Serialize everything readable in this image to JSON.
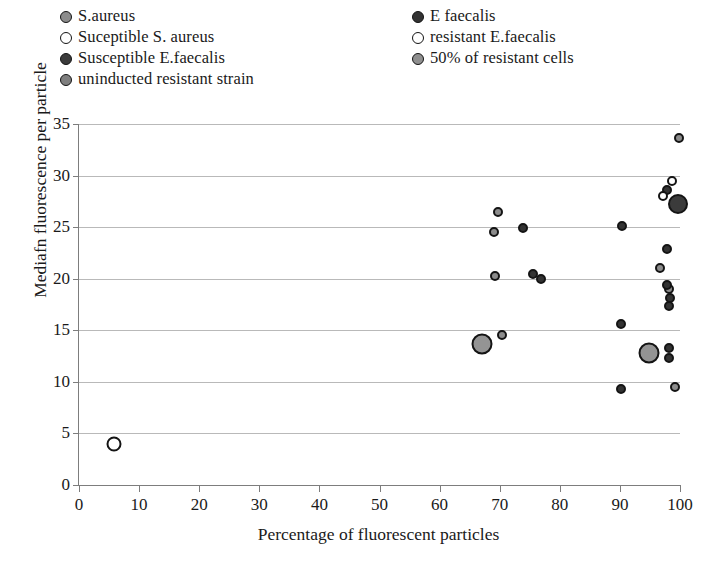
{
  "legend": {
    "left_column": [
      {
        "label": "S.aureus",
        "marker": "circle",
        "fill": "#8c8c8c",
        "stroke": "#141414"
      },
      {
        "label": "Suceptible S. aureus",
        "marker": "circle",
        "fill": "#ffffff",
        "stroke": "#141414"
      },
      {
        "label": "Susceptible E.faecalis",
        "marker": "circle",
        "fill": "#3b3b3b",
        "stroke": "#141414"
      },
      {
        "label": "uninducted resistant strain",
        "marker": "circle",
        "fill": "#7f7f7f",
        "stroke": "#141414"
      }
    ],
    "right_column": [
      {
        "label": "E faecalis",
        "marker": "circle",
        "fill": "#333333",
        "stroke": "#141414"
      },
      {
        "label": "resistant E.faecalis",
        "marker": "circle",
        "fill": "#ffffff",
        "stroke": "#141414"
      },
      {
        "label": "50% of resistant cells",
        "marker": "circle",
        "fill": "#8f8f8f",
        "stroke": "#141414"
      }
    ]
  },
  "chart_data": {
    "type": "scatter",
    "title": "",
    "xlabel": "Percentage of fluorescent particles",
    "ylabel": "Mediafn fluorescence per particle",
    "xlim": [
      0,
      100
    ],
    "ylim": [
      0,
      35
    ],
    "xticks": [
      0,
      10,
      20,
      30,
      40,
      50,
      60,
      70,
      80,
      90,
      100
    ],
    "yticks": [
      0,
      5,
      10,
      15,
      20,
      25,
      30,
      35
    ],
    "grid": "horizontal",
    "legend_position": "above-plot",
    "series": [
      {
        "name": "Suceptible S. aureus",
        "fill": "#ffffff",
        "stroke": "#141414",
        "size": 15,
        "points": [
          {
            "x": 5.8,
            "y": 4.0
          }
        ]
      },
      {
        "name": "S.aureus",
        "fill": "#8c8c8c",
        "stroke": "#141414",
        "size": 10,
        "points": [
          {
            "x": 69.8,
            "y": 26.5
          },
          {
            "x": 69.0,
            "y": 24.5
          },
          {
            "x": 69.3,
            "y": 20.3
          },
          {
            "x": 70.4,
            "y": 14.5
          },
          {
            "x": 99.8,
            "y": 33.6
          },
          {
            "x": 96.7,
            "y": 21.0
          },
          {
            "x": 98.1,
            "y": 19.0
          },
          {
            "x": 99.2,
            "y": 9.5
          }
        ]
      },
      {
        "name": "E faecalis",
        "fill": "#333333",
        "stroke": "#141414",
        "size": 10,
        "points": [
          {
            "x": 73.9,
            "y": 24.9
          },
          {
            "x": 75.5,
            "y": 20.5
          },
          {
            "x": 76.8,
            "y": 20.0
          },
          {
            "x": 90.3,
            "y": 25.1
          },
          {
            "x": 90.2,
            "y": 15.6
          },
          {
            "x": 90.2,
            "y": 9.3
          },
          {
            "x": 97.8,
            "y": 28.6
          },
          {
            "x": 97.9,
            "y": 22.9
          },
          {
            "x": 97.9,
            "y": 19.4
          },
          {
            "x": 98.4,
            "y": 18.1
          },
          {
            "x": 98.1,
            "y": 17.4
          },
          {
            "x": 98.2,
            "y": 13.3
          },
          {
            "x": 98.2,
            "y": 12.3
          }
        ]
      },
      {
        "name": "resistant E.faecalis",
        "fill": "#ffffff",
        "stroke": "#141414",
        "size": 10,
        "points": [
          {
            "x": 98.7,
            "y": 29.5
          },
          {
            "x": 97.1,
            "y": 28.0
          }
        ]
      },
      {
        "name": "Susceptible E.faecalis",
        "fill": "#3b3b3b",
        "stroke": "#141414",
        "size": 20,
        "points": [
          {
            "x": 99.6,
            "y": 27.2
          }
        ]
      },
      {
        "name": "50% of resistant cells",
        "fill": "#949494",
        "stroke": "#141414",
        "size": 21,
        "points": [
          {
            "x": 67.0,
            "y": 13.7
          },
          {
            "x": 94.8,
            "y": 12.8
          }
        ]
      }
    ]
  }
}
